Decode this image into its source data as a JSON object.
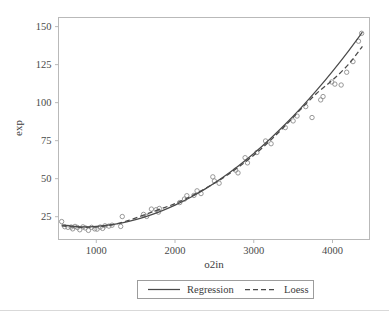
{
  "chart_data": {
    "type": "scatter",
    "title": "",
    "xlabel": "o2in",
    "ylabel": "exp",
    "xlim": [
      520,
      4470
    ],
    "ylim": [
      10,
      156
    ],
    "xticks": [
      1000,
      2000,
      3000,
      4000
    ],
    "yticks": [
      25,
      50,
      75,
      100,
      125,
      150
    ],
    "xtick_labels": [
      "1000",
      "2000",
      "3000",
      "4000"
    ],
    "ytick_labels": [
      "25",
      "50",
      "75",
      "100",
      "125",
      "150"
    ],
    "grid": false,
    "legend_position": "below-axis-outside",
    "marker_style": "open-circle",
    "marker_color": "#8d8d8d",
    "line_color": "#4a4a4a",
    "frame_color": "#b9b9b9",
    "points": [
      {
        "x": 560,
        "y": 21.8
      },
      {
        "x": 600,
        "y": 18.4
      },
      {
        "x": 640,
        "y": 18.0
      },
      {
        "x": 680,
        "y": 18.2
      },
      {
        "x": 700,
        "y": 17.0
      },
      {
        "x": 730,
        "y": 18.6
      },
      {
        "x": 760,
        "y": 17.9
      },
      {
        "x": 790,
        "y": 16.4
      },
      {
        "x": 830,
        "y": 18.3
      },
      {
        "x": 860,
        "y": 17.6
      },
      {
        "x": 900,
        "y": 16.0
      },
      {
        "x": 940,
        "y": 18.0
      },
      {
        "x": 980,
        "y": 17.0
      },
      {
        "x": 1010,
        "y": 16.8
      },
      {
        "x": 1050,
        "y": 18.2
      },
      {
        "x": 1080,
        "y": 17.3
      },
      {
        "x": 1110,
        "y": 19.0
      },
      {
        "x": 1160,
        "y": 18.8
      },
      {
        "x": 1200,
        "y": 19.4
      },
      {
        "x": 1310,
        "y": 18.6
      },
      {
        "x": 1330,
        "y": 25.1
      },
      {
        "x": 1600,
        "y": 26.5
      },
      {
        "x": 1640,
        "y": 25.2
      },
      {
        "x": 1700,
        "y": 30.0
      },
      {
        "x": 1760,
        "y": 29.6
      },
      {
        "x": 1790,
        "y": 28.0
      },
      {
        "x": 1800,
        "y": 30.4
      },
      {
        "x": 2060,
        "y": 34.3
      },
      {
        "x": 2120,
        "y": 36.6
      },
      {
        "x": 2150,
        "y": 38.8
      },
      {
        "x": 2240,
        "y": 39.0
      },
      {
        "x": 2280,
        "y": 42.0
      },
      {
        "x": 2330,
        "y": 40.2
      },
      {
        "x": 2480,
        "y": 51.2
      },
      {
        "x": 2500,
        "y": 48.5
      },
      {
        "x": 2560,
        "y": 47.0
      },
      {
        "x": 2770,
        "y": 55.6
      },
      {
        "x": 2800,
        "y": 53.8
      },
      {
        "x": 2890,
        "y": 63.8
      },
      {
        "x": 2920,
        "y": 60.4
      },
      {
        "x": 3040,
        "y": 67.2
      },
      {
        "x": 3150,
        "y": 74.8
      },
      {
        "x": 3220,
        "y": 73.0
      },
      {
        "x": 3400,
        "y": 83.6
      },
      {
        "x": 3500,
        "y": 88.0
      },
      {
        "x": 3550,
        "y": 91.2
      },
      {
        "x": 3660,
        "y": 97.4
      },
      {
        "x": 3740,
        "y": 90.2
      },
      {
        "x": 3850,
        "y": 101.8
      },
      {
        "x": 3880,
        "y": 104.0
      },
      {
        "x": 3990,
        "y": 113.6
      },
      {
        "x": 4030,
        "y": 112.2
      },
      {
        "x": 4110,
        "y": 111.6
      },
      {
        "x": 4180,
        "y": 120.0
      },
      {
        "x": 4260,
        "y": 127.0
      },
      {
        "x": 4330,
        "y": 140.4
      },
      {
        "x": 4370,
        "y": 145.6
      }
    ],
    "series": [
      {
        "name": "Regression",
        "style": "solid",
        "x": [
          560,
          800,
          1000,
          1200,
          1400,
          1600,
          1800,
          2000,
          2200,
          2400,
          2600,
          2800,
          3000,
          3200,
          3400,
          3600,
          3800,
          4000,
          4200,
          4380
        ],
        "values": [
          19.6,
          18.3,
          18.6,
          19.8,
          21.8,
          24.6,
          28.2,
          32.6,
          37.8,
          43.8,
          50.6,
          58.2,
          66.6,
          75.8,
          85.8,
          96.6,
          108.2,
          120.6,
          133.8,
          146.4
        ]
      },
      {
        "name": "Loess",
        "style": "dashed",
        "x": [
          560,
          800,
          1000,
          1200,
          1400,
          1600,
          1800,
          2000,
          2200,
          2400,
          2600,
          2800,
          3000,
          3200,
          3400,
          3600,
          3800,
          4000,
          4200,
          4380
        ],
        "values": [
          19.0,
          18.0,
          18.3,
          19.6,
          22.4,
          26.0,
          29.8,
          33.6,
          38.4,
          44.0,
          50.2,
          57.4,
          65.4,
          74.6,
          84.8,
          95.8,
          106.2,
          114.8,
          125.0,
          137.0
        ]
      }
    ]
  },
  "axes": {
    "x_title": "o2in",
    "y_title": "exp"
  },
  "legend": {
    "entries": [
      {
        "label": "Regression",
        "style": "solid"
      },
      {
        "label": "Loess",
        "style": "dashed"
      }
    ]
  }
}
